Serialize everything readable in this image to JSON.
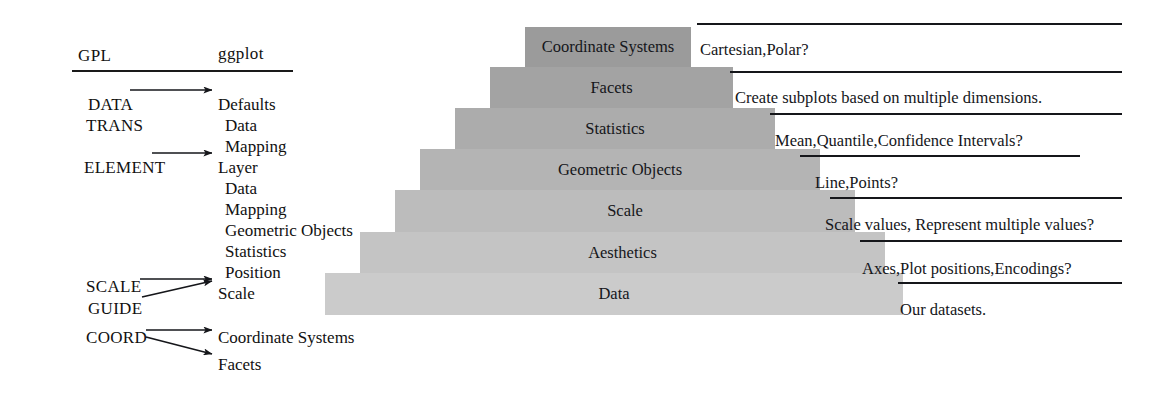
{
  "legend": {
    "headers": {
      "gpl": "GPL",
      "ggplot": "ggplot"
    },
    "gpl_terms": [
      {
        "label": "DATA",
        "x": 88,
        "y": 95
      },
      {
        "label": "TRANS",
        "x": 86,
        "y": 116
      },
      {
        "label": "ELEMENT",
        "x": 84,
        "y": 158
      },
      {
        "label": "SCALE",
        "x": 86,
        "y": 277
      },
      {
        "label": "GUIDE",
        "x": 88,
        "y": 299
      },
      {
        "label": "COORD",
        "x": 86,
        "y": 328
      }
    ],
    "ggplot_terms": [
      {
        "label": "Defaults",
        "x": 218,
        "y": 95
      },
      {
        "label": "Data",
        "x": 225,
        "y": 116
      },
      {
        "label": "Mapping",
        "x": 225,
        "y": 137
      },
      {
        "label": "Layer",
        "x": 218,
        "y": 158
      },
      {
        "label": "Data",
        "x": 225,
        "y": 179
      },
      {
        "label": "Mapping",
        "x": 225,
        "y": 200
      },
      {
        "label": "Geometric Objects",
        "x": 225,
        "y": 221
      },
      {
        "label": "Statistics",
        "x": 225,
        "y": 242
      },
      {
        "label": "Position",
        "x": 225,
        "y": 263
      },
      {
        "label": "Scale",
        "x": 218,
        "y": 284
      },
      {
        "label": "Coordinate Systems",
        "x": 218,
        "y": 328
      },
      {
        "label": "Facets",
        "x": 218,
        "y": 355
      }
    ]
  },
  "pyramid": {
    "steps": [
      {
        "label": "Coordinate Systems",
        "left": 525,
        "top": 27,
        "width": 166,
        "height": 40,
        "color": "#9b9b9b"
      },
      {
        "label": "Facets",
        "left": 490,
        "top": 67,
        "width": 243,
        "height": 41,
        "color": "#a3a3a3"
      },
      {
        "label": "Statistics",
        "left": 455,
        "top": 108,
        "width": 320,
        "height": 41,
        "color": "#acacac"
      },
      {
        "label": "Geometric Objects",
        "left": 420,
        "top": 149,
        "width": 400,
        "height": 41,
        "color": "#b4b4b4"
      },
      {
        "label": "Scale",
        "left": 395,
        "top": 190,
        "width": 460,
        "height": 42,
        "color": "#bcbcbc"
      },
      {
        "label": "Aesthetics",
        "left": 360,
        "top": 232,
        "width": 525,
        "height": 41,
        "color": "#c4c4c4"
      },
      {
        "label": "Data",
        "left": 325,
        "top": 273,
        "width": 578,
        "height": 42,
        "color": "#cbcbcb"
      }
    ]
  },
  "annotations": [
    {
      "text": "Cartesian,Polar?",
      "text_x": 700,
      "text_y": 40,
      "rule_x": 697,
      "rule_y": 23,
      "rule_w": 425
    },
    {
      "text": "Create subplots based on multiple dimensions.",
      "text_x": 735,
      "text_y": 88,
      "rule_x": 730,
      "rule_y": 71,
      "rule_w": 392
    },
    {
      "text": "Mean,Quantile,Confidence Intervals?",
      "text_x": 775,
      "text_y": 131,
      "rule_x": 770,
      "rule_y": 113,
      "rule_w": 352
    },
    {
      "text": "Line,Points?",
      "text_x": 815,
      "text_y": 173,
      "rule_x": 800,
      "rule_y": 155,
      "rule_w": 280
    },
    {
      "text": "Scale values, Represent multiple values?",
      "text_x": 825,
      "text_y": 215,
      "rule_x": 830,
      "rule_y": 197,
      "rule_w": 292
    },
    {
      "text": "Axes,Plot positions,Encodings?",
      "text_x": 862,
      "text_y": 259,
      "rule_x": 860,
      "rule_y": 240,
      "rule_w": 262
    },
    {
      "text": "Our datasets.",
      "text_x": 900,
      "text_y": 300,
      "rule_x": 898,
      "rule_y": 282,
      "rule_w": 224
    }
  ],
  "arrows": [
    {
      "name": "arrow-data-to-defaults",
      "x1": 130,
      "y1": 90,
      "x2": 212,
      "y2": 90
    },
    {
      "name": "arrow-element-to-layer",
      "x1": 152,
      "y1": 153,
      "x2": 212,
      "y2": 153
    },
    {
      "name": "arrow-scale-to-scale",
      "x1": 140,
      "y1": 279,
      "x2": 212,
      "y2": 279
    },
    {
      "name": "arrow-guide-to-scale",
      "x1": 142,
      "y1": 297,
      "x2": 212,
      "y2": 281
    },
    {
      "name": "arrow-coord-to-coordsys",
      "x1": 146,
      "y1": 330,
      "x2": 212,
      "y2": 330
    },
    {
      "name": "arrow-coord-to-facets",
      "x1": 146,
      "y1": 337,
      "x2": 212,
      "y2": 354
    }
  ],
  "colors": {
    "ink": "#15161a",
    "rule": "#1a1a1a",
    "background": "#ffffff",
    "pyramid_top": "#9b9b9b",
    "pyramid_bottom": "#cbcbcb"
  }
}
